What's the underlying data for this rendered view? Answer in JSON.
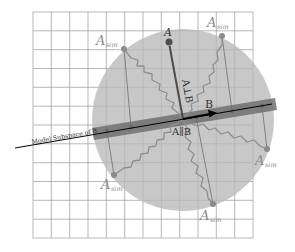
{
  "diagram": {
    "grid": {
      "x0": 33,
      "y0": 12,
      "x1": 253,
      "y1": 238,
      "cols": 12,
      "rows": 12,
      "color": "#9a9a9a"
    },
    "circle": {
      "cx": 183,
      "cy": 120,
      "r": 91,
      "color": "#c4c4c4"
    },
    "band": {
      "x1": 93,
      "y1": 134,
      "x2": 276,
      "y2": 104,
      "width": 12,
      "color": "#7d7d7d"
    },
    "subspace_line": {
      "x1": 15,
      "y1": 148,
      "x2": 272,
      "y2": 104,
      "color": "#000000"
    },
    "labels": {
      "model_subspace": "Model Subspace of B",
      "A": "A",
      "A_perp_B": "A⊥B",
      "A_par_B": "A∥B",
      "B": "B",
      "A_sim_base": "A",
      "A_sim_sub": "sim"
    },
    "vector_A": {
      "x1": 183,
      "y1": 119,
      "x2": 169,
      "y2": 42,
      "color": "#555555"
    },
    "vector_B": {
      "x1": 183,
      "y1": 119,
      "x2": 215,
      "y2": 113,
      "color": "#000000"
    },
    "sim_points": [
      {
        "x": 124,
        "y": 49,
        "proj_x": 131,
        "proj_y": 124,
        "label_x": 96,
        "label_y": 44
      },
      {
        "x": 222,
        "y": 36,
        "proj_x": 232,
        "proj_y": 112,
        "label_x": 206,
        "label_y": 26
      },
      {
        "x": 267,
        "y": 149,
        "proj_x": 262,
        "proj_y": 107,
        "label_x": 262,
        "label_y": 166
      },
      {
        "x": 213,
        "y": 204,
        "proj_x": 196,
        "proj_y": 119,
        "label_x": 204,
        "label_y": 220
      },
      {
        "x": 114,
        "y": 175,
        "proj_x": 107,
        "proj_y": 131,
        "label_x": 100,
        "label_y": 190
      }
    ]
  }
}
